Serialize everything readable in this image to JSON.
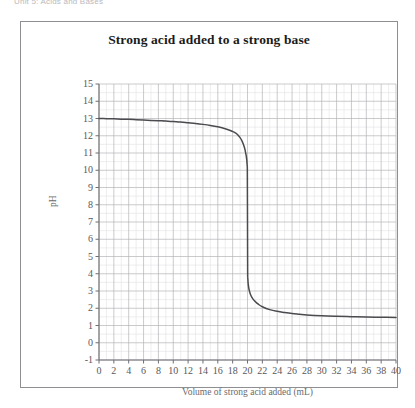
{
  "page": {
    "header_fragment": "Unit 5: Acids and Bases"
  },
  "figure": {
    "title": "Strong acid added to a strong base"
  },
  "axes": {
    "x_title": "Volume of strong acid added (mL)",
    "y_title": "pH",
    "x_ticks": [
      "0",
      "2",
      "4",
      "6",
      "8",
      "10",
      "12",
      "14",
      "16",
      "18",
      "20",
      "22",
      "24",
      "26",
      "28",
      "30",
      "32",
      "34",
      "36",
      "38",
      "40"
    ],
    "y_ticks": [
      "15",
      "14",
      "13",
      "12",
      "11",
      "10",
      "9",
      "8",
      "7",
      "6",
      "5",
      "4",
      "3",
      "2",
      "1",
      "0",
      "-1"
    ]
  },
  "colors": {
    "curve": "#4a4a4f",
    "frame": "#8e8e93",
    "axis": "#6f6f74",
    "grid_major": "#b4b4b9",
    "grid_minor": "#e2e2e6",
    "title_text": "#1b1b1b",
    "tick_text": "#58585c",
    "background": "#ffffff"
  },
  "chart_data": {
    "type": "line",
    "title": "Strong acid added to a strong base",
    "xlabel": "Volume of strong acid added (mL)",
    "ylabel": "pH",
    "xlim": [
      0,
      40
    ],
    "ylim": [
      -1,
      15
    ],
    "x_tick_step": 2,
    "y_tick_step": 1,
    "grid": true,
    "legend": "none",
    "equivalence_point": {
      "volume": 20,
      "pH": 7
    },
    "series": [
      {
        "name": "Titration curve",
        "x": [
          0,
          1,
          2,
          3,
          4,
          5,
          6,
          7,
          8,
          9,
          10,
          11,
          12,
          13,
          14,
          15,
          16,
          17,
          18,
          18.5,
          19,
          19.3,
          19.6,
          19.8,
          19.9,
          19.95,
          19.98,
          20,
          20.02,
          20.05,
          20.1,
          20.2,
          20.4,
          20.7,
          21,
          21.5,
          22,
          23,
          24,
          25,
          26,
          27,
          28,
          30,
          32,
          34,
          36,
          38,
          40
        ],
        "y": [
          13.0,
          12.99,
          12.98,
          12.96,
          12.95,
          12.93,
          12.91,
          12.89,
          12.87,
          12.85,
          12.82,
          12.79,
          12.75,
          12.71,
          12.66,
          12.6,
          12.52,
          12.41,
          12.25,
          12.13,
          11.89,
          11.66,
          11.3,
          10.9,
          10.6,
          10.3,
          9.9,
          7.0,
          4.1,
          3.7,
          3.4,
          3.1,
          2.8,
          2.56,
          2.41,
          2.22,
          2.09,
          1.92,
          1.82,
          1.75,
          1.69,
          1.65,
          1.61,
          1.56,
          1.53,
          1.51,
          1.49,
          1.48,
          1.47
        ]
      }
    ],
    "annotations": [
      {
        "text": "Initial pH (strong base)",
        "pH": 13.0
      },
      {
        "text": "Final pH plateau (excess strong acid)",
        "pH": 1.5
      }
    ]
  }
}
